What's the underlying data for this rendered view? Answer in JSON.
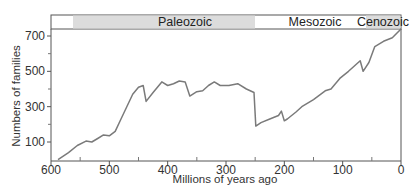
{
  "chart_data": {
    "type": "line",
    "title": "",
    "xlabel": "Millions of years ago",
    "ylabel": "Numbers of families",
    "xlim": [
      600,
      0
    ],
    "ylim": [
      -7,
      740
    ],
    "x_ticks": [
      600,
      500,
      400,
      300,
      200,
      100,
      0
    ],
    "x_minor_ticks": [
      550,
      450,
      350,
      250,
      150,
      50
    ],
    "y_ticks": [
      100,
      300,
      500,
      700
    ],
    "y_minor_ticks": [
      200,
      400,
      600
    ],
    "grid": false,
    "legend": null,
    "eras": [
      {
        "name": "Paleozoic",
        "start": 562,
        "end": 251,
        "shaded": true
      },
      {
        "name": "Mesozoic",
        "start": 251,
        "end": 60,
        "shaded": false
      },
      {
        "name": "Cenozoic",
        "start": 60,
        "end": 0,
        "shaded": true
      }
    ],
    "series": [
      {
        "name": "Marine animal families",
        "x": [
          588,
          570,
          555,
          540,
          530,
          520,
          510,
          500,
          490,
          480,
          470,
          460,
          450,
          442,
          437,
          425,
          410,
          400,
          390,
          380,
          370,
          362,
          350,
          340,
          330,
          320,
          310,
          295,
          280,
          265,
          252,
          249,
          240,
          225,
          210,
          205,
          200,
          195,
          180,
          170,
          150,
          130,
          120,
          105,
          90,
          70,
          65,
          55,
          45,
          30,
          15,
          0
        ],
        "values": [
          0,
          40,
          80,
          105,
          100,
          120,
          140,
          135,
          160,
          230,
          300,
          370,
          410,
          420,
          330,
          380,
          440,
          420,
          430,
          445,
          440,
          360,
          385,
          390,
          420,
          440,
          420,
          420,
          430,
          400,
          380,
          190,
          210,
          230,
          250,
          275,
          220,
          230,
          270,
          300,
          340,
          390,
          400,
          460,
          500,
          560,
          500,
          550,
          640,
          670,
          690,
          740
        ]
      }
    ]
  },
  "labels": {
    "xlabel": "Millions of years ago",
    "ylabel": "Numbers of families",
    "eras": [
      "Paleozoic",
      "Mesozoic",
      "Cenozoic"
    ],
    "x_ticks": [
      "600",
      "500",
      "400",
      "300",
      "200",
      "100",
      "0"
    ],
    "y_ticks": [
      "100",
      "300",
      "500",
      "700"
    ]
  },
  "colors": {
    "line": "#7a7a7a",
    "axis": "#555555",
    "era_shade": "#dcdcdc",
    "background": "#ffffff"
  }
}
